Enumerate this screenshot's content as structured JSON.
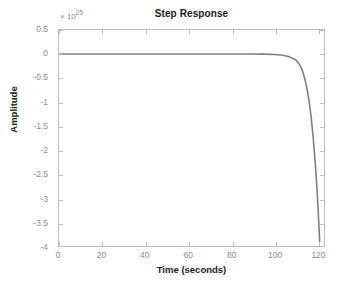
{
  "chart_data": {
    "type": "line",
    "title": "Step Response",
    "xlabel": "Time (seconds)",
    "ylabel": "Amplitude",
    "exponent_multiplier": "× 10",
    "exponent_power": "25",
    "y_scale_factor": 1e+25,
    "xlim": [
      0,
      123
    ],
    "ylim": [
      -4,
      0.5
    ],
    "grid": false,
    "legend": null,
    "line_color": "#7f7f7f",
    "xticks": [
      0,
      20,
      40,
      60,
      80,
      100,
      120
    ],
    "xtick_labels": [
      "0",
      "20",
      "40",
      "60",
      "80",
      "100",
      "120"
    ],
    "yticks": [
      0.5,
      0,
      -0.5,
      -1,
      -1.5,
      -2,
      -2.5,
      -3,
      -3.5,
      -4
    ],
    "ytick_labels": [
      "0.5",
      "0",
      "-0.5",
      "-1",
      "-1.5",
      "-2",
      "-2.5",
      "-3",
      "-3.5",
      "-4"
    ],
    "series": [
      {
        "name": "step-response",
        "x": [
          0,
          5,
          10,
          15,
          20,
          25,
          30,
          35,
          40,
          45,
          50,
          55,
          60,
          65,
          70,
          75,
          80,
          85,
          90,
          95,
          100,
          103,
          105,
          107,
          109,
          110,
          111,
          112,
          113,
          114,
          115,
          116,
          117,
          118,
          119,
          120,
          120.5,
          121
        ],
        "y": [
          0,
          0,
          0,
          0,
          0,
          0,
          0,
          0,
          0,
          0,
          0,
          0,
          0,
          0,
          0,
          0,
          0,
          0,
          0,
          -0.002,
          -0.01,
          -0.02,
          -0.035,
          -0.06,
          -0.1,
          -0.13,
          -0.18,
          -0.25,
          -0.35,
          -0.5,
          -0.7,
          -0.95,
          -1.3,
          -1.75,
          -2.3,
          -3.0,
          -3.45,
          -3.9
        ]
      }
    ],
    "annotation": "Unstable step response diverging to -3.9e25 near t = 121 s"
  },
  "figure": {
    "background_color": "#ffffff",
    "axes_color": "#bdbdbd",
    "text_color": "#1a1a1a",
    "tick_label_color": "#8c8c8c"
  }
}
